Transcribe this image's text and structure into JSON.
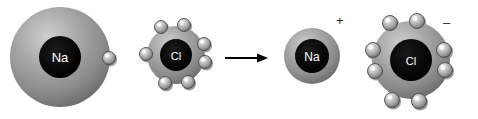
{
  "diagram": {
    "background_color": "#ffffff",
    "width": 478,
    "height": 119,
    "reactants": [
      {
        "name": "sodium-atom",
        "label": "Na",
        "charge": "",
        "shell_electron_count": 1,
        "shell_color": "#8f8f8f",
        "nucleus_color": "#000000",
        "label_color": "#ffffff",
        "cx": 60,
        "cy": 57,
        "r": 50,
        "nucleus_r": 21,
        "label_size": 13,
        "electrons": [
          {
            "cx": 109,
            "cy": 58,
            "r": 6.5
          }
        ]
      },
      {
        "name": "chlorine-atom",
        "label": "Cl",
        "charge": "",
        "shell_electron_count": 7,
        "shell_color": "#8f8f8f",
        "nucleus_color": "#000000",
        "label_color": "#ffffff",
        "cx": 176,
        "cy": 55,
        "r": 29,
        "nucleus_r": 16,
        "label_size": 11,
        "electrons": [
          {
            "cx": 161,
            "cy": 27,
            "r": 6.5
          },
          {
            "cx": 184,
            "cy": 25,
            "r": 6.5
          },
          {
            "cx": 204,
            "cy": 44,
            "r": 6.5
          },
          {
            "cx": 205,
            "cy": 62,
            "r": 6.5
          },
          {
            "cx": 188,
            "cy": 82,
            "r": 6.5
          },
          {
            "cx": 165,
            "cy": 83,
            "r": 6.5
          },
          {
            "cx": 146,
            "cy": 54,
            "r": 6.5
          }
        ]
      }
    ],
    "arrow": {
      "name": "reaction-arrow",
      "color": "#000000",
      "x1": 225,
      "y1": 58,
      "x2": 268,
      "y2": 58,
      "head_length": 11,
      "head_width": 9,
      "shaft_width": 2
    },
    "products": [
      {
        "name": "sodium-ion",
        "label": "Na",
        "charge": "+",
        "charge_x": 336,
        "charge_y": 14,
        "shell_electron_count": 0,
        "shell_color": "#8f8f8f",
        "nucleus_color": "#000000",
        "label_color": "#ffffff",
        "cx": 312,
        "cy": 56,
        "r": 28,
        "nucleus_r": 17,
        "label_size": 12,
        "electrons": []
      },
      {
        "name": "chloride-ion",
        "label": "Cl",
        "charge": "–",
        "charge_x": 443,
        "charge_y": 16,
        "shell_electron_count": 8,
        "shell_color": "#8f8f8f",
        "nucleus_color": "#000000",
        "label_color": "#ffffff",
        "cx": 411,
        "cy": 60,
        "r": 39,
        "nucleus_r": 21,
        "label_size": 11,
        "electrons": [
          {
            "cx": 390,
            "cy": 23,
            "r": 7.5
          },
          {
            "cx": 417,
            "cy": 21,
            "r": 7.5
          },
          {
            "cx": 444,
            "cy": 50,
            "r": 7.5
          },
          {
            "cx": 445,
            "cy": 70,
            "r": 7.5
          },
          {
            "cx": 419,
            "cy": 101,
            "r": 7.5
          },
          {
            "cx": 392,
            "cy": 100,
            "r": 7.5
          },
          {
            "cx": 375,
            "cy": 71,
            "r": 7.5
          },
          {
            "cx": 373,
            "cy": 50,
            "r": 7.5
          }
        ]
      }
    ]
  }
}
